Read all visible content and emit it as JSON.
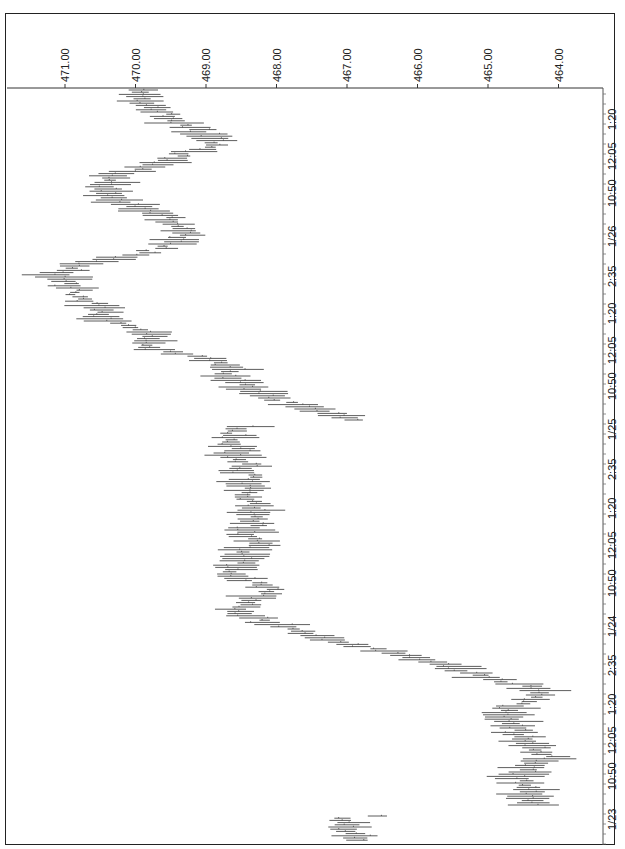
{
  "chart_data": {
    "type": "bar",
    "subtype": "high-low price bars (rotated 90 degrees clockwise)",
    "orientation": "rotated",
    "title": "",
    "xlabel": "",
    "ylabel": "",
    "price_axis": {
      "position": "top",
      "ticks": [
        "471.00",
        "470.00",
        "469.00",
        "468.00",
        "467.00",
        "466.00",
        "465.00",
        "464.00"
      ],
      "tick_values": [
        471,
        470,
        469,
        468,
        467,
        466,
        465,
        464
      ],
      "range": [
        471.8,
        463.4
      ],
      "grid": false
    },
    "time_axis": {
      "position": "right",
      "ticks": [
        "1:20",
        "12:05",
        "10:50",
        "1/26",
        "2:35",
        "1:20",
        "12:05",
        "10:50",
        "1/25",
        "2:35",
        "1:20",
        "12:05",
        "10:50",
        "1/24",
        "2:35",
        "1:20",
        "12:05",
        "10:50",
        "1/23"
      ],
      "tick_pos": [
        118,
        158,
        195,
        235,
        275,
        312,
        352,
        388,
        428,
        468,
        507,
        547,
        585,
        625,
        664,
        703,
        742,
        778,
        818
      ],
      "order": "latest at top, earliest at bottom"
    },
    "path": {
      "description": "Approximate mid-price of bars along the time axis (pixel y position -> price)",
      "y": [
        90,
        100,
        110,
        120,
        132,
        145,
        155,
        165,
        175,
        185,
        195,
        205,
        215,
        225,
        235,
        245,
        255,
        265,
        275,
        285,
        295,
        305,
        320,
        335,
        350,
        360,
        370,
        380,
        395,
        410,
        420,
        428,
        440,
        460,
        475,
        490,
        505,
        520,
        535,
        545,
        560,
        575,
        590,
        600,
        610,
        625,
        640,
        655,
        665,
        675,
        685,
        695,
        705,
        715,
        725,
        735,
        745,
        755,
        765,
        775,
        785,
        795,
        805,
        818,
        828,
        838,
        845
      ],
      "price": [
        469.9,
        470.0,
        469.7,
        469.4,
        469.1,
        468.9,
        469.4,
        469.6,
        470.3,
        470.4,
        470.5,
        470.1,
        469.6,
        469.4,
        469.3,
        469.5,
        470.0,
        470.9,
        471.1,
        470.9,
        470.8,
        470.6,
        470.4,
        469.8,
        469.7,
        468.9,
        468.7,
        468.6,
        468.2,
        467.5,
        466.8,
        468.6,
        468.6,
        468.5,
        468.4,
        468.4,
        468.3,
        468.3,
        468.4,
        468.3,
        468.5,
        468.6,
        468.1,
        468.3,
        468.6,
        468.0,
        467.3,
        466.2,
        465.6,
        465.2,
        464.5,
        464.3,
        464.6,
        464.8,
        464.6,
        464.5,
        464.4,
        464.1,
        464.3,
        464.6,
        464.4,
        464.5,
        464.2,
        467.1,
        467.0,
        466.9,
        466.9
      ]
    }
  },
  "layout": {
    "plot_left": 7,
    "plot_right": 603,
    "plot_top": 88,
    "plot_bottom": 845,
    "px_per_unit": 70.5,
    "x_at_471": 65
  }
}
